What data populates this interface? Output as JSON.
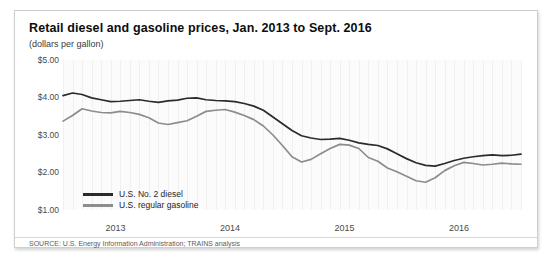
{
  "card": {
    "title": "Retail diesel and gasoline prices, Jan. 2013 to Sept. 2016",
    "subtitle": "(dollars per gallon)",
    "source": "SOURCE: U.S. Energy Information Administration; TRAINS analysis"
  },
  "chart_data": {
    "type": "line",
    "title": "Retail diesel and gasoline prices, Jan. 2013 to Sept. 2016",
    "subtitle": "(dollars per gallon)",
    "xlabel": "",
    "ylabel": "",
    "ylim": [
      1.0,
      5.0
    ],
    "yticks": [
      5.0,
      4.0,
      3.0,
      2.0,
      1.0
    ],
    "ytick_labels": [
      "$5.00",
      "$4.00",
      "$3.00",
      "$2.00",
      "$1.00"
    ],
    "xticks": [
      2013,
      2014,
      2015,
      2016
    ],
    "xtick_labels": [
      "2013",
      "2014",
      "2015",
      "2016"
    ],
    "xlim": [
      "2013-01",
      "2016-09"
    ],
    "grid": "vertical-faint",
    "legend_position": "inside-bottom-left",
    "colors": {
      "diesel": "#2b2b2b",
      "gasoline": "#8c8c8c"
    },
    "series": [
      {
        "name": "U.S. No. 2 diesel",
        "color": "#2b2b2b",
        "values": [
          4.05,
          4.12,
          4.08,
          3.99,
          3.94,
          3.89,
          3.9,
          3.92,
          3.94,
          3.9,
          3.87,
          3.91,
          3.93,
          3.98,
          3.99,
          3.94,
          3.92,
          3.91,
          3.89,
          3.84,
          3.77,
          3.66,
          3.48,
          3.3,
          3.12,
          2.98,
          2.92,
          2.88,
          2.89,
          2.91,
          2.86,
          2.79,
          2.75,
          2.72,
          2.63,
          2.5,
          2.37,
          2.26,
          2.19,
          2.17,
          2.24,
          2.32,
          2.38,
          2.42,
          2.45,
          2.47,
          2.45,
          2.46,
          2.49
        ]
      },
      {
        "name": "U.S. regular gasoline",
        "color": "#8c8c8c",
        "values": [
          3.37,
          3.52,
          3.7,
          3.64,
          3.6,
          3.59,
          3.63,
          3.6,
          3.55,
          3.46,
          3.32,
          3.28,
          3.33,
          3.38,
          3.5,
          3.63,
          3.66,
          3.68,
          3.61,
          3.52,
          3.41,
          3.24,
          3.0,
          2.72,
          2.42,
          2.28,
          2.35,
          2.5,
          2.64,
          2.75,
          2.73,
          2.64,
          2.4,
          2.3,
          2.12,
          2.02,
          1.9,
          1.78,
          1.74,
          1.86,
          2.05,
          2.18,
          2.27,
          2.24,
          2.2,
          2.22,
          2.25,
          2.23,
          2.22
        ]
      }
    ]
  },
  "legend": {
    "items": [
      {
        "label": "U.S. No. 2 diesel",
        "color": "#2b2b2b"
      },
      {
        "label": "U.S. regular gasoline",
        "color": "#8c8c8c"
      }
    ]
  }
}
